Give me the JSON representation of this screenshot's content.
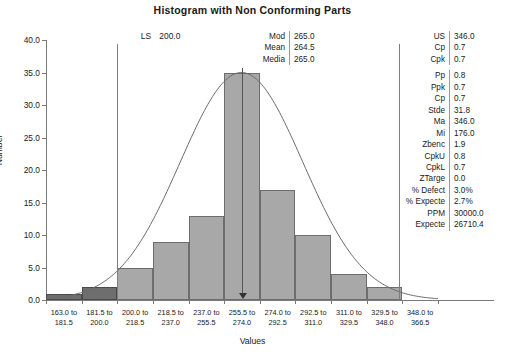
{
  "chart_data": {
    "type": "bar",
    "title": "Histogram with Non Conforming Parts",
    "xlabel": "Values",
    "ylabel": "Number",
    "ylim": [
      0,
      40
    ],
    "ytick_step": 5,
    "ytick_labels": [
      "40.0",
      "35.0",
      "30.0",
      "25.0",
      "20.0",
      "15.0",
      "10.0",
      "5.0",
      "0.0"
    ],
    "grid": false,
    "legend": "none",
    "categories": [
      "163.0 to 181.5",
      "181.5 to 200.0",
      "200.0 to 218.5",
      "218.5 to 237.0",
      "237.0 to 255.5",
      "255.5 to 274.0",
      "274.0 to 292.5",
      "292.5 to 311.0",
      "311.0 to 329.5",
      "329.5 to 348.0",
      "348.0 to 366.5"
    ],
    "category_lines": [
      [
        "163.0 to",
        "181.5"
      ],
      [
        "181.5 to",
        "200.0"
      ],
      [
        "200.0 to",
        "218.5"
      ],
      [
        "218.5 to",
        "237.0"
      ],
      [
        "237.0 to",
        "255.5"
      ],
      [
        "255.5 to",
        "274.0"
      ],
      [
        "274.0 to",
        "292.5"
      ],
      [
        "292.5 to",
        "311.0"
      ],
      [
        "311.0 to",
        "329.5"
      ],
      [
        "329.5 to",
        "348.0"
      ],
      [
        "348.0 to",
        "366.5"
      ]
    ],
    "values": [
      1,
      2,
      5,
      9,
      13,
      35,
      17,
      10,
      4,
      2,
      0
    ],
    "nonconforming": [
      true,
      true,
      false,
      false,
      false,
      false,
      false,
      false,
      false,
      false,
      false
    ],
    "bin_edges": [
      163.0,
      181.5,
      200.0,
      218.5,
      237.0,
      255.5,
      274.0,
      292.5,
      311.0,
      329.5,
      348.0,
      366.5
    ],
    "overlay_curve": {
      "kind": "normal",
      "mean": 264.5,
      "stdev": 31.8,
      "peak": 35
    },
    "annotations": {
      "lower_spec": 200.0,
      "upper_spec": 346.0,
      "center_marker": 265.0
    }
  },
  "colors": {
    "bar_conforming": "#a8a8a8",
    "bar_nonconforming": "#6e6e6e",
    "bar_border": "#6d6d6d",
    "axis": "#7a7a7a",
    "curve": "#6b6b6b",
    "text": "#1a1a1a"
  },
  "lower_spec": {
    "key": "LS",
    "value": "200.0"
  },
  "center_stats": [
    {
      "key": "Mod",
      "value": "265.0"
    },
    {
      "key": "Mean",
      "value": "264.5"
    },
    {
      "key": "Media",
      "value": "265.0"
    }
  ],
  "right_stats_group1": [
    {
      "key": "US",
      "value": "346.0"
    },
    {
      "key": "Cp",
      "value": "0.7"
    },
    {
      "key": "Cpk",
      "value": "0.7"
    }
  ],
  "right_stats_group2": [
    {
      "key": "Pp",
      "value": "0.8"
    },
    {
      "key": "Ppk",
      "value": "0.7"
    },
    {
      "key": "Cp",
      "value": "0.7"
    },
    {
      "key": "Stde",
      "value": "31.8"
    },
    {
      "key": "Ma",
      "value": "346.0"
    },
    {
      "key": "Mi",
      "value": "176.0"
    },
    {
      "key": "Zbenc",
      "value": "1.9"
    },
    {
      "key": "CpkU",
      "value": "0.8"
    },
    {
      "key": "CpkL",
      "value": "0.7"
    },
    {
      "key": "ZTarge",
      "value": "0.0"
    },
    {
      "key": "% Defect",
      "value": "3.0%"
    },
    {
      "key": "% Expecte",
      "value": "2.7%"
    },
    {
      "key": "PPM",
      "value": "30000.0"
    },
    {
      "key": "Expecte",
      "value": "26710.4"
    }
  ]
}
